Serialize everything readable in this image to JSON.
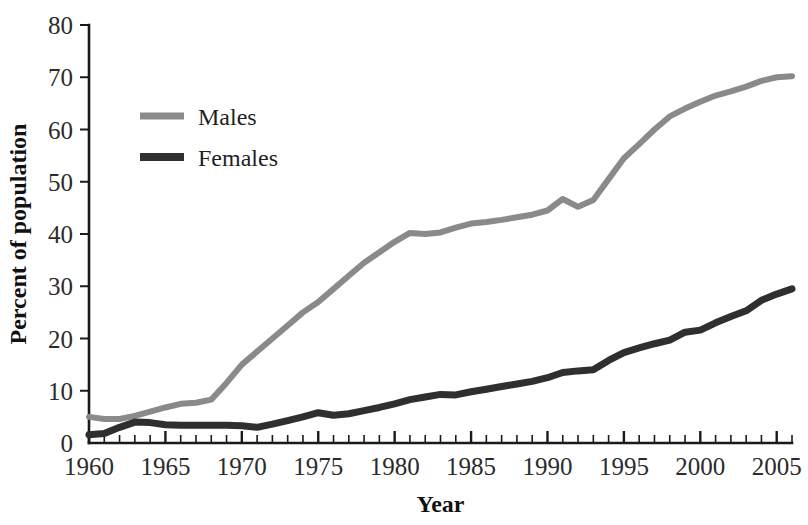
{
  "chart_data": {
    "type": "line",
    "title": "",
    "xlabel": "Year",
    "ylabel": "Percent of population",
    "xlim": [
      1960,
      2006
    ],
    "ylim": [
      0,
      80
    ],
    "grid": false,
    "legend_position": "upper-left-inside",
    "x_tick_labels": [
      "1960",
      "1965",
      "1970",
      "1975",
      "1980",
      "1985",
      "1990",
      "1995",
      "2000",
      "2005"
    ],
    "x_tick_values": [
      1960,
      1965,
      1970,
      1975,
      1980,
      1985,
      1990,
      1995,
      2000,
      2005
    ],
    "x_minor_tick_step": 1,
    "y_tick_labels": [
      "0",
      "10",
      "20",
      "30",
      "40",
      "50",
      "60",
      "70",
      "80"
    ],
    "y_tick_values": [
      0,
      10,
      20,
      30,
      40,
      50,
      60,
      70,
      80
    ],
    "x": [
      1960,
      1961,
      1962,
      1963,
      1964,
      1965,
      1966,
      1967,
      1968,
      1969,
      1970,
      1971,
      1972,
      1973,
      1974,
      1975,
      1976,
      1977,
      1978,
      1979,
      1980,
      1981,
      1982,
      1983,
      1984,
      1985,
      1986,
      1987,
      1988,
      1989,
      1990,
      1991,
      1992,
      1993,
      1994,
      1995,
      1996,
      1997,
      1998,
      1999,
      2000,
      2001,
      2002,
      2003,
      2004,
      2005,
      2006
    ],
    "series": [
      {
        "name": "Males",
        "color": "#8a8a8a",
        "values": [
          5.0,
          4.6,
          4.6,
          5.2,
          6.0,
          6.8,
          7.5,
          7.7,
          8.3,
          11.5,
          15.0,
          17.5,
          20.0,
          22.5,
          25.0,
          27.0,
          29.5,
          32.0,
          34.5,
          36.5,
          38.5,
          40.2,
          40.0,
          40.3,
          41.2,
          42.0,
          42.3,
          42.7,
          43.2,
          43.7,
          44.5,
          46.7,
          45.2,
          46.5,
          50.5,
          54.5,
          57.2,
          60.0,
          62.5,
          64.0,
          65.3,
          66.5,
          67.3,
          68.2,
          69.3,
          70.0,
          70.2
        ]
      },
      {
        "name": "Females",
        "color": "#2f2f2f",
        "values": [
          1.6,
          1.8,
          3.0,
          4.0,
          3.9,
          3.5,
          3.4,
          3.4,
          3.4,
          3.4,
          3.3,
          3.0,
          3.6,
          4.3,
          5.0,
          5.8,
          5.3,
          5.6,
          6.2,
          6.8,
          7.5,
          8.3,
          8.8,
          9.3,
          9.2,
          9.8,
          10.3,
          10.8,
          11.3,
          11.8,
          12.5,
          13.5,
          13.8,
          14.0,
          15.8,
          17.3,
          18.2,
          19.0,
          19.7,
          21.2,
          21.6,
          23.0,
          24.2,
          25.3,
          27.3,
          28.5,
          29.5
        ]
      }
    ]
  },
  "legend": {
    "items": [
      {
        "label": "Males",
        "color": "#8a8a8a"
      },
      {
        "label": "Females",
        "color": "#2f2f2f"
      }
    ]
  },
  "axes": {
    "x_title": "Year",
    "y_title": "Percent of population"
  }
}
